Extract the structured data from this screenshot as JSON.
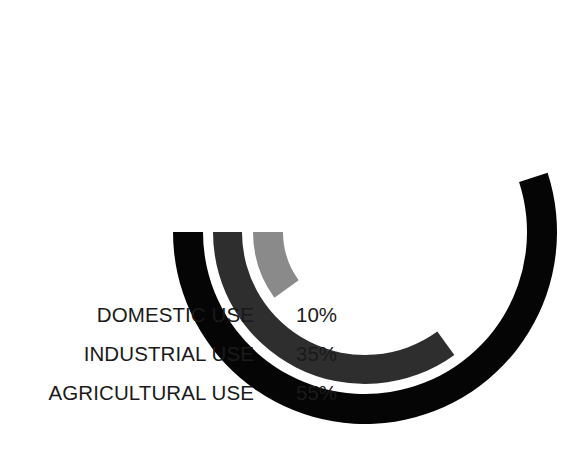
{
  "chart_data": {
    "type": "pie",
    "variant": "radial-bar",
    "title": "",
    "subtitle": "",
    "xlabel": "",
    "ylabel": "",
    "grid": false,
    "legend_position": "left",
    "units": "%",
    "value_max": 100,
    "geometry": {
      "center_x": 365,
      "center_y": 232,
      "start_angle_deg": 180,
      "direction": "counterclockwise",
      "full_sweep_deg": 360
    },
    "categories": [
      "DOMESTIC USE",
      "INDUSTRIAL USE",
      "AGRICULTURAL USE"
    ],
    "values": [
      10,
      35,
      55
    ],
    "value_labels": [
      "10%",
      "35%",
      "55%"
    ],
    "colors": [
      "#8a8a8a",
      "#2e2e2e",
      "#050505"
    ],
    "series": [
      {
        "name": "Share of water use",
        "values": [
          10,
          35,
          55
        ]
      }
    ],
    "rings": [
      {
        "name": "domestic-use",
        "label": "DOMESTIC USE",
        "value": 10,
        "value_label": "10%",
        "color": "#8a8a8a",
        "outer_radius": 112,
        "inner_radius": 82,
        "sweep_deg": 36
      },
      {
        "name": "industrial-use",
        "label": "INDUSTRIAL USE",
        "value": 35,
        "value_label": "35%",
        "color": "#2e2e2e",
        "outer_radius": 152,
        "inner_radius": 123,
        "sweep_deg": 126
      },
      {
        "name": "agricultural-use",
        "label": "AGRICULTURAL USE",
        "value": 55,
        "value_label": "55%",
        "color": "#050505",
        "outer_radius": 192,
        "inner_radius": 162,
        "sweep_deg": 198
      }
    ]
  },
  "legend": {
    "rows": [
      {
        "label": "DOMESTIC USE",
        "value": "10%",
        "swatch": "#8a8a8a"
      },
      {
        "label": "INDUSTRIAL USE",
        "value": "35%",
        "swatch": "#2e2e2e"
      },
      {
        "label": "AGRICULTURAL USE",
        "value": "55%",
        "swatch": "#050505"
      }
    ]
  },
  "canvas": {
    "background": "#ffffff",
    "text_color": "#1a1a1a"
  }
}
